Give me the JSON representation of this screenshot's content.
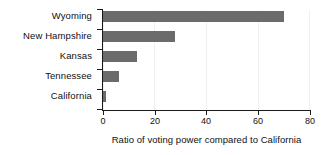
{
  "chart_data": {
    "type": "bar",
    "orientation": "horizontal",
    "title": "",
    "xlabel": "Ratio of voting power compared to California",
    "ylabel": "",
    "categories": [
      "Wyoming",
      "New Hampshire",
      "Kansas",
      "Tennessee",
      "California"
    ],
    "values": [
      70,
      27.8,
      13,
      6.2,
      1.2
    ],
    "xlim": [
      0,
      80
    ],
    "xticks": [
      0,
      20,
      40,
      60,
      80
    ],
    "xtick_labels": [
      "0",
      "20",
      "40",
      "60",
      "80"
    ],
    "grid": true,
    "legend": false,
    "bar_color": "#6b6b6b",
    "axis_color": "#1a1a1a",
    "background": "#ffffff"
  }
}
